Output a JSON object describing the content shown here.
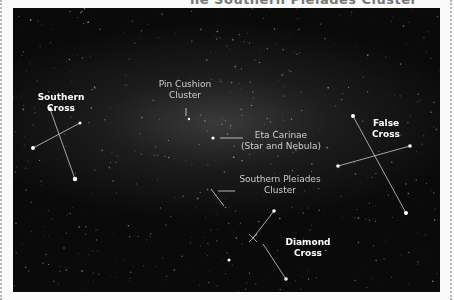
{
  "caption": "he Southern Pleiades Cluster",
  "labels": {
    "southern_cross": [
      "Southern",
      "Cross"
    ],
    "pin_cushion": [
      "Pin Cushion",
      "Cluster"
    ],
    "eta_carinae": [
      "Eta Carinae",
      "(Star and Nebula)"
    ],
    "southern_pleiades": [
      "Southern Pleiades",
      "Cluster"
    ],
    "false_cross": [
      "False",
      "Cross"
    ],
    "diamond_cross": [
      "Diamond",
      "Cross"
    ]
  }
}
